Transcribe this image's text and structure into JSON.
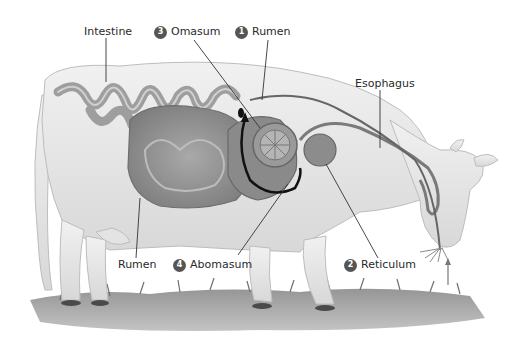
{
  "diagram": {
    "labels": [
      {
        "id": "intestine",
        "text": "Intestine",
        "number": null
      },
      {
        "id": "omasum",
        "text": "Omasum",
        "number": "3"
      },
      {
        "id": "rumen-top",
        "text": "Rumen",
        "number": "1"
      },
      {
        "id": "esophagus",
        "text": "Esophagus",
        "number": null
      },
      {
        "id": "rumen-bottom",
        "text": "Rumen",
        "number": null
      },
      {
        "id": "abomasum",
        "text": "Abomasum",
        "number": "4"
      },
      {
        "id": "reticulum",
        "text": "Reticulum",
        "number": "2"
      }
    ],
    "colors": {
      "body": "#e8e8e8",
      "organ": "#8f8f8f",
      "organ_dark": "#6e6e6e",
      "grass": "#7a7a7a",
      "badge": "#555555",
      "text": "#2a2a2a"
    }
  }
}
